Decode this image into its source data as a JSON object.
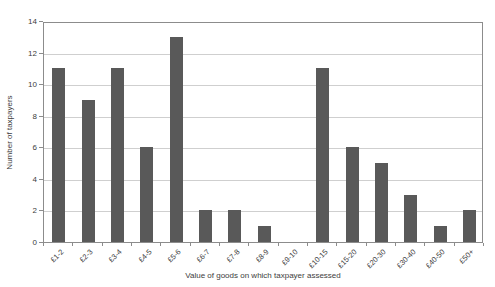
{
  "chart_data": {
    "type": "bar",
    "cropped_title_fragment": "taxpayer assessments",
    "categories": [
      "£1-2",
      "£2-3",
      "£3-4",
      "£4-5",
      "£5-6",
      "£6-7",
      "£7-8",
      "£8-9",
      "£9-10",
      "£10-15",
      "£15-20",
      "£20-30",
      "£30-40",
      "£40-50",
      "£50+"
    ],
    "values": [
      11,
      9,
      11,
      6,
      13,
      2,
      2,
      1,
      0,
      11,
      6,
      5,
      3,
      1,
      2
    ],
    "ylabel": "Number of taxpayers",
    "xlabel": "Value of goods on which taxpayer assessed",
    "ylim": [
      0,
      14
    ],
    "yticks": [
      0,
      2,
      4,
      6,
      8,
      10,
      12,
      14
    ],
    "grid": "horizontal",
    "legend": "none",
    "bar_color": "#595959",
    "grid_color": "#cfcfcf",
    "axis_color": "#8c8c8c",
    "text_color": "#3d3d3d",
    "plot_background": "#ffffff"
  }
}
